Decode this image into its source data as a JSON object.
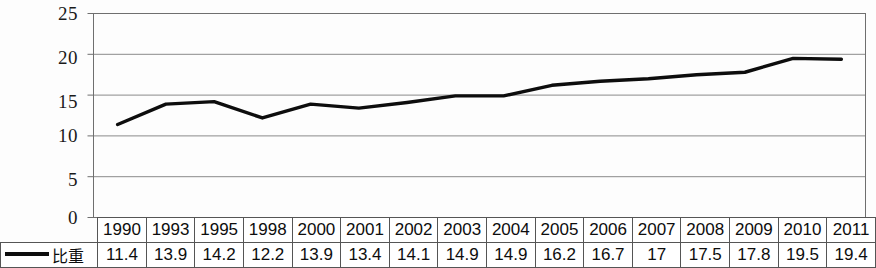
{
  "chart_data": {
    "type": "line",
    "title": "",
    "xlabel": "",
    "ylabel": "",
    "ylim": [
      0,
      25
    ],
    "yticks": [
      "0",
      "5",
      "10",
      "15",
      "20",
      "25"
    ],
    "grid": true,
    "legend_position": "table-left",
    "categories": [
      "1990",
      "1993",
      "1995",
      "1998",
      "2000",
      "2001",
      "2002",
      "2003",
      "2004",
      "2005",
      "2006",
      "2007",
      "2008",
      "2009",
      "2010",
      "2011"
    ],
    "series": [
      {
        "name": "比重",
        "color": "#0d0d0d",
        "values": [
          11.4,
          13.9,
          14.2,
          12.2,
          13.9,
          13.4,
          14.1,
          14.9,
          14.9,
          16.2,
          16.7,
          17,
          17.5,
          17.8,
          19.5,
          19.4
        ],
        "value_labels": [
          "11.4",
          "13.9",
          "14.2",
          "12.2",
          "13.9",
          "13.4",
          "14.1",
          "14.9",
          "14.9",
          "16.2",
          "16.7",
          "17",
          "17.5",
          "17.8",
          "19.5",
          "19.4"
        ]
      }
    ]
  },
  "legend": {
    "series_label": "比重",
    "marker": "line-marker"
  },
  "axis": {
    "y_labels": [
      "25",
      "20",
      "15",
      "10",
      "5",
      "0"
    ]
  }
}
